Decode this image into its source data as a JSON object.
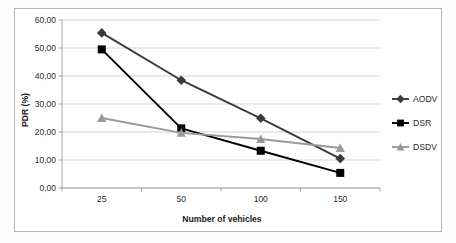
{
  "chart_data": {
    "type": "line",
    "title": "",
    "subtitle": "",
    "xlabel": "Number of vehicles",
    "ylabel": "PDR (%)",
    "categories": [
      "25",
      "50",
      "100",
      "150"
    ],
    "x": [
      25,
      50,
      100,
      150
    ],
    "series": [
      {
        "name": "AODV",
        "marker": "diamond",
        "color": "#3a3a3a",
        "values": [
          55.4,
          38.5,
          24.9,
          10.5
        ]
      },
      {
        "name": "DSR",
        "marker": "square",
        "color": "#000000",
        "values": [
          49.5,
          21.3,
          13.3,
          5.4
        ]
      },
      {
        "name": "DSDV",
        "marker": "triangle",
        "color": "#9a9a9a",
        "values": [
          25.0,
          19.7,
          17.5,
          14.3
        ]
      }
    ],
    "ylim": [
      0,
      60
    ],
    "yticks": [
      0,
      10,
      20,
      30,
      40,
      50,
      60
    ],
    "ytick_labels": [
      "0,00",
      "10,00",
      "20,00",
      "30,00",
      "40,00",
      "50,00",
      "60,00"
    ],
    "xtick_labels": [
      "25",
      "50",
      "100",
      "150"
    ],
    "grid": "horizontal",
    "legend_position": "right",
    "legend_entries": [
      {
        "label": "AODV",
        "marker": "diamond-marker",
        "color": "#3a3a3a"
      },
      {
        "label": "DSR",
        "marker": "square-marker",
        "color": "#000000"
      },
      {
        "label": "DSDV",
        "marker": "triangle-marker",
        "color": "#9a9a9a"
      }
    ],
    "axis_colors": {
      "grid": "#c8c8c8",
      "axis": "#9a9a9a",
      "text": "#2b2b2b",
      "frame": "#b9b9b9"
    }
  }
}
